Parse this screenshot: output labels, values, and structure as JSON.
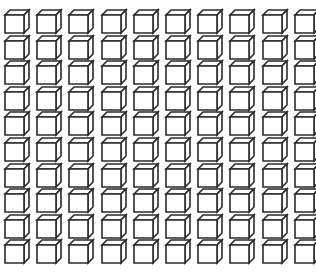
{
  "figure": {
    "rows": 10,
    "columns": 10,
    "total_cubes": 100,
    "colors": {
      "background": "#ffffff",
      "stroke": "#2b2b2b",
      "fill": "#ffffff"
    },
    "layout": {
      "origin_x": 5,
      "origin_y": 15,
      "col_pitch": 32.2,
      "row_pitch": 25.6,
      "front_width": 19,
      "front_height": 18,
      "depth_dx": 5,
      "depth_dy": 5
    }
  }
}
